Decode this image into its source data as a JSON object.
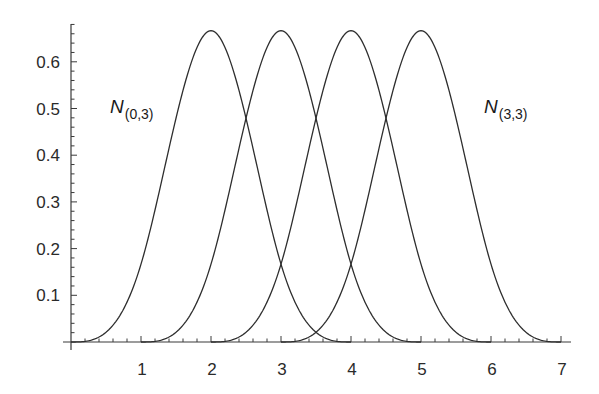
{
  "chart_data": {
    "type": "line",
    "title": "",
    "xlabel": "",
    "ylabel": "",
    "xlim": [
      0,
      7
    ],
    "ylim": [
      0,
      0.6667
    ],
    "grid": false,
    "legend": "none (inline labels)",
    "x_ticks": [
      1,
      2,
      3,
      4,
      5,
      6,
      7
    ],
    "x_tick_labels": [
      "1",
      "2",
      "3",
      "4",
      "5",
      "6",
      "7"
    ],
    "y_ticks": [
      0.1,
      0.2,
      0.3,
      0.4,
      0.5,
      0.6
    ],
    "y_tick_labels": [
      "0.1",
      "0.2",
      "0.3",
      "0.4",
      "0.5",
      "0.6"
    ],
    "x_minor_step": 0.2,
    "y_minor_step": 0.02,
    "series": [
      {
        "name": "N(0,3)",
        "support": [
          0,
          4
        ],
        "peak_x": 2,
        "peak_y": 0.6667,
        "x": [
          0,
          0.5,
          1,
          1.5,
          2,
          2.5,
          3,
          3.5,
          4
        ],
        "values": [
          0,
          0.0208,
          0.1667,
          0.4792,
          0.6667,
          0.4792,
          0.1667,
          0.0208,
          0
        ]
      },
      {
        "name": "N(1,3)",
        "support": [
          1,
          5
        ],
        "peak_x": 3,
        "peak_y": 0.6667,
        "x": [
          1,
          1.5,
          2,
          2.5,
          3,
          3.5,
          4,
          4.5,
          5
        ],
        "values": [
          0,
          0.0208,
          0.1667,
          0.4792,
          0.6667,
          0.4792,
          0.1667,
          0.0208,
          0
        ]
      },
      {
        "name": "N(2,3)",
        "support": [
          2,
          6
        ],
        "peak_x": 4,
        "peak_y": 0.6667,
        "x": [
          2,
          2.5,
          3,
          3.5,
          4,
          4.5,
          5,
          5.5,
          6
        ],
        "values": [
          0,
          0.0208,
          0.1667,
          0.4792,
          0.6667,
          0.4792,
          0.1667,
          0.0208,
          0
        ]
      },
      {
        "name": "N(3,3)",
        "support": [
          3,
          7
        ],
        "peak_x": 5,
        "peak_y": 0.6667,
        "x": [
          3,
          3.5,
          4,
          4.5,
          5,
          5.5,
          6,
          6.5,
          7
        ],
        "values": [
          0,
          0.0208,
          0.1667,
          0.4792,
          0.6667,
          0.4792,
          0.1667,
          0.0208,
          0
        ]
      }
    ],
    "annotations": [
      {
        "text": "N",
        "subscript": "(0,3)",
        "x": 0.55,
        "y": 0.5
      },
      {
        "text": "N",
        "subscript": "(3,3)",
        "x": 5.95,
        "y": 0.5
      }
    ]
  },
  "labels": {
    "left": {
      "main": "N",
      "sub": "(0,3)"
    },
    "right": {
      "main": "N",
      "sub": "(3,3)"
    }
  },
  "colors": {
    "line": "#2e2e2e",
    "axis": "#3a3a3a",
    "text": "#2a2a2a",
    "background": "#ffffff"
  }
}
